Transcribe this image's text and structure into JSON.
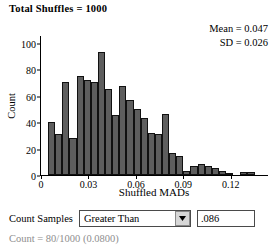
{
  "header": {
    "title": "Total Shuffles = 1000"
  },
  "stats": {
    "mean_label": "Mean = 0.047",
    "sd_label": "SD = 0.026",
    "mean": 0.047,
    "sd": 0.026
  },
  "controls": {
    "count_samples_label": "Count Samples",
    "comparison_selected": "Greater Than",
    "comparison_options": [
      "Greater Than"
    ],
    "threshold_value": ".086",
    "dropdown_icon": "chevron-down-icon"
  },
  "result": {
    "text": "Count = 80/1000 (0.0800)",
    "count": 80,
    "total": 1000,
    "proportion": "0.0800"
  },
  "chart_data": {
    "type": "bar",
    "title": "",
    "xlabel": "Shuffled MADs",
    "ylabel": "Count",
    "xlim": [
      0,
      0.1435
    ],
    "ylim": [
      0,
      105
    ],
    "grid": false,
    "legend": null,
    "xticks": [
      0,
      0.03,
      0.06,
      0.09,
      0.12
    ],
    "xtick_labels": [
      "0",
      "0.03",
      "0.06",
      "0.09",
      "0.12"
    ],
    "yticks": [
      0,
      20,
      40,
      60,
      80,
      100
    ],
    "ytick_labels": [
      "0",
      "20",
      "40",
      "60",
      "80",
      "100"
    ],
    "bin_width": 0.0045,
    "bin_starts": [
      0.0045,
      0.009,
      0.0135,
      0.018,
      0.0225,
      0.027,
      0.0315,
      0.036,
      0.0405,
      0.045,
      0.0495,
      0.054,
      0.0585,
      0.063,
      0.0675,
      0.072,
      0.0765,
      0.081,
      0.0855,
      0.09,
      0.0945,
      0.099,
      0.1035,
      0.108,
      0.1125,
      0.117,
      0.1215,
      0.126,
      0.1305,
      0.135,
      0.1395
    ],
    "values": [
      40,
      31,
      70,
      28,
      75,
      72,
      70,
      93,
      65,
      45,
      67,
      57,
      50,
      43,
      32,
      31,
      46,
      17,
      14,
      3,
      7,
      8,
      7,
      5,
      3,
      1,
      0,
      2,
      2,
      0,
      0
    ],
    "bar_color": "#5e5e5e",
    "bar_edge_color": "#111111"
  }
}
